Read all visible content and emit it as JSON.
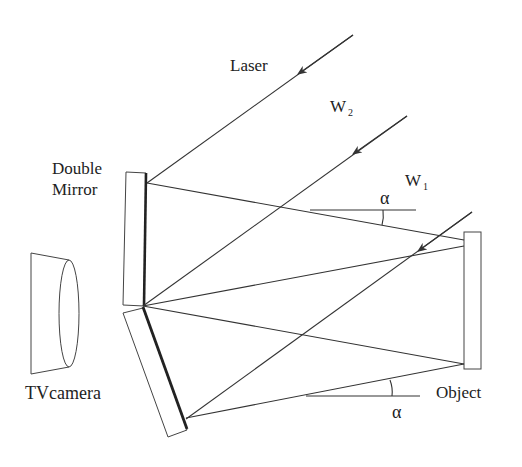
{
  "diagram": {
    "labels": {
      "laser": "Laser",
      "w2_main": "W",
      "w2_sub": "2",
      "w1_main": "W",
      "w1_sub": "1",
      "double_mirror_line1": "Double",
      "double_mirror_line2": "Mirror",
      "tv_camera": "TVcamera",
      "object": "Object",
      "alpha_top": "α",
      "alpha_bottom": "α"
    },
    "components": [
      "Laser beam",
      "Wavefront W2",
      "Wavefront W1",
      "Double Mirror",
      "TV camera",
      "Object"
    ],
    "colors": {
      "line": "#333333",
      "text": "#222222",
      "background": "#ffffff"
    }
  }
}
